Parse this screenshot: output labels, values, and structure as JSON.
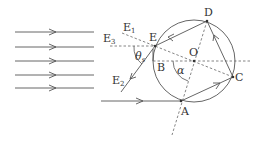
{
  "diagram": {
    "labels": {
      "E": "E",
      "E1": "E",
      "E1_sub": "1",
      "E2": "E",
      "E2_sub": "2",
      "E3": "E",
      "E3_sub": "3",
      "D": "D",
      "O": "O",
      "B": "B",
      "C": "C",
      "A": "A",
      "alpha": "α",
      "theta": "θ",
      "theta_sub": "s"
    },
    "incident_rays_count": 5,
    "colors": {
      "line": "#555555",
      "dash": "#666666",
      "background": "#ffffff"
    }
  }
}
